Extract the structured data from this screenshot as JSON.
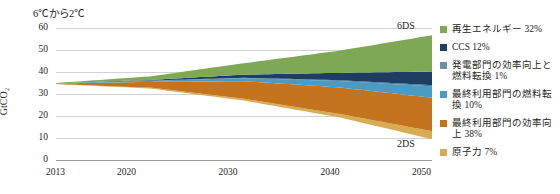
{
  "chart_data": {
    "type": "area",
    "title": "6℃から2℃",
    "xlabel": "",
    "ylabel": "GtCO₂",
    "x": [
      2013,
      2020,
      2030,
      2040,
      2050
    ],
    "xlim": [
      2013,
      2050
    ],
    "ylim": [
      0,
      60
    ],
    "yticks": [
      0,
      10,
      20,
      30,
      40,
      50,
      60
    ],
    "xticks": [
      "2013",
      "2020",
      "2030",
      "2040",
      "2050"
    ],
    "grid": true,
    "legend_position": "right",
    "stacked": true,
    "annotations": [
      {
        "text": "6DS",
        "x": 2050,
        "y": 53
      },
      {
        "text": "2DS",
        "x": 2050,
        "y": 9
      }
    ],
    "baseline_2ds": [
      34.5,
      32.5,
      27.0,
      19.5,
      9.5
    ],
    "total_6ds": [
      35.0,
      38.0,
      44.0,
      49.0,
      54.5
    ],
    "series": [
      {
        "name": "再生エネルギー 32%",
        "share": "32%",
        "color": "#7fa855",
        "values": [
          0.2,
          1.6,
          5.2,
          10.0,
          16.5
        ]
      },
      {
        "name": "CCS 12%",
        "share": "12%",
        "color": "#1f3d63",
        "values": [
          0.0,
          0.3,
          1.4,
          3.3,
          6.2
        ]
      },
      {
        "name": "発電部門の効率向上と燃料転換 1%",
        "share": "1%",
        "color": "#3d7fa6",
        "values": [
          0.0,
          0.1,
          0.2,
          0.35,
          0.5
        ]
      },
      {
        "name": "最終利用部門の燃料転換 10%",
        "share": "10%",
        "color": "#4a9bc4",
        "values": [
          0.05,
          0.5,
          1.4,
          2.9,
          5.2
        ]
      },
      {
        "name": "最終利用部門の効率向上 38%",
        "share": "38%",
        "color": "#c4741f",
        "values": [
          0.25,
          2.6,
          8.0,
          12.0,
          15.2
        ]
      },
      {
        "name": "原子力 7%",
        "share": "7%",
        "color": "#d8ac52",
        "values": [
          0.0,
          0.4,
          0.8,
          1.55,
          3.6
        ]
      }
    ]
  },
  "legend": {
    "items": [
      {
        "label": "再生エネルギー 32%",
        "color": "#7fa855"
      },
      {
        "label": "CCS 12%",
        "color": "#1f3d63"
      },
      {
        "label": "発電部門の効率向上と燃料転換 1%",
        "color": "#6b8ea3"
      },
      {
        "label": "最終利用部門の燃料転換 10%",
        "color": "#4a9bc4"
      },
      {
        "label": "最終利用部門の効率向上 38%",
        "color": "#c4741f"
      },
      {
        "label": "原子力 7%",
        "color": "#d8ac52"
      }
    ]
  }
}
